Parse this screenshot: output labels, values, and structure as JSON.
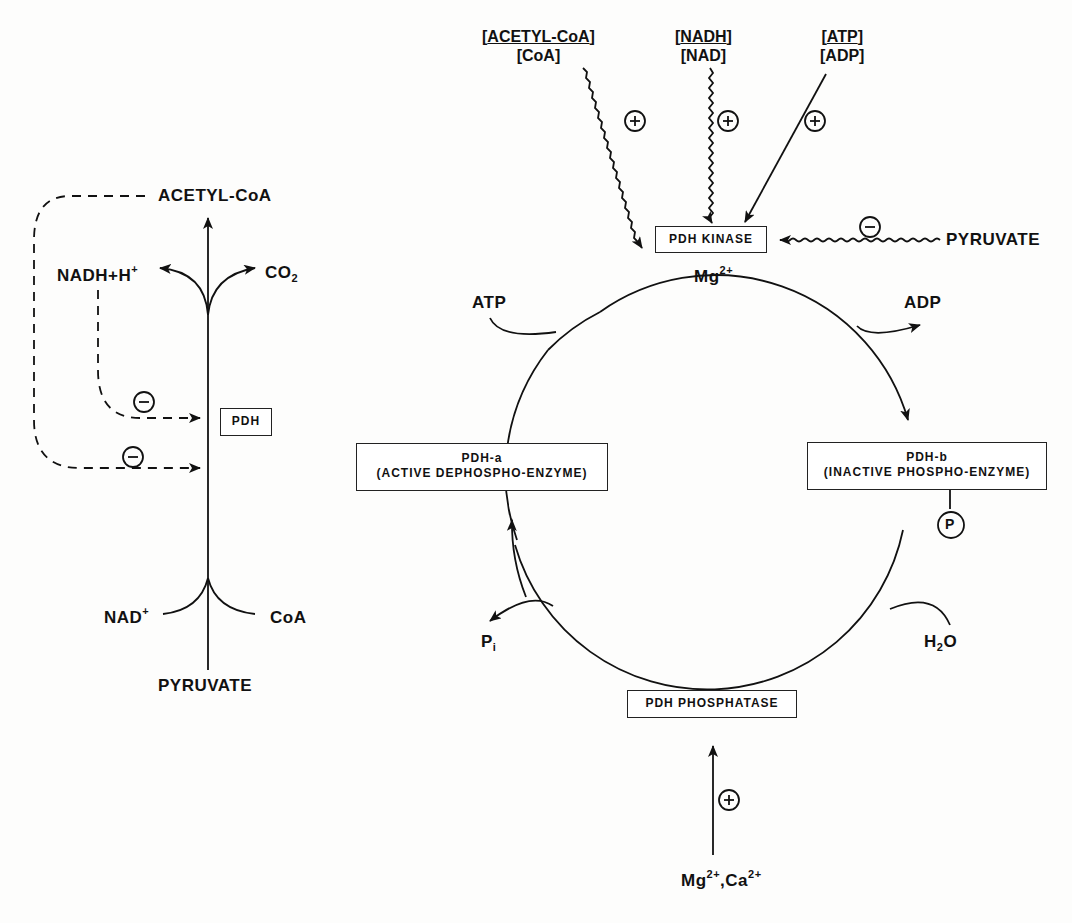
{
  "left_pathway": {
    "product": "ACETYL-CoA",
    "substrate": "PYRUVATE",
    "enzyme": "PDH",
    "inputs": [
      {
        "label": "NAD",
        "sup": "+"
      },
      {
        "label": "CoA"
      }
    ],
    "outputs": [
      {
        "label": "NADH+H",
        "sup": "+"
      },
      {
        "label": "CO",
        "sub": "2"
      }
    ],
    "inhibition_sign": "−"
  },
  "regulators": [
    {
      "numerator": "ACETYL-CoA",
      "denominator": "CoA",
      "effect": "+"
    },
    {
      "numerator": "NADH",
      "denominator": "NAD",
      "effect": "+"
    },
    {
      "numerator": "ATP",
      "denominator": "ADP",
      "effect": "+"
    }
  ],
  "kinase": {
    "label": "PDH KINASE",
    "cofactor": "Mg",
    "cofactor_sup": "2+",
    "inhibitor": "PYRUVATE",
    "inhibitor_effect": "−"
  },
  "cycle": {
    "atp": "ATP",
    "adp": "ADP",
    "pdh_a": {
      "line1": "PDH-a",
      "line2": "(ACTIVE DEPHOSPHO-ENZYME)"
    },
    "pdh_b": {
      "line1": "PDH-b",
      "line2": "(INACTIVE PHOSPHO-ENZYME)"
    },
    "phosphate_tag": "P",
    "pi": "P",
    "pi_sub": "i",
    "water": "H",
    "water_sub": "2",
    "water_end": "O"
  },
  "phosphatase": {
    "label": "PDH PHOSPHATASE",
    "effect": "+",
    "activator_a": "Mg",
    "activator_b": ",Ca",
    "sup": "2+"
  }
}
